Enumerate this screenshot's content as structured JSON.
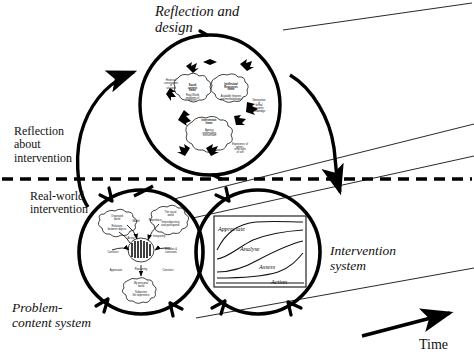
{
  "figure": {
    "title_top": "Reflection and\ndesign",
    "label_reflection_about": "Reflection\nabout\nintervention",
    "label_realworld": "Real-world\nintervention",
    "label_problem_content": "Problem-\ncontent system",
    "label_intervention_system": "Intervention\nsystem",
    "label_time": "Time",
    "divider": "dashed-horizontal-line"
  },
  "circles": {
    "reflection": {
      "name": "reflection-and-design-circle",
      "cx": 210,
      "cy": 105,
      "r": 70
    },
    "problem": {
      "name": "problem-content-system-circle",
      "cx": 141,
      "cy": 252,
      "r": 62
    },
    "intervention": {
      "name": "intervention-system-circle",
      "cx": 258,
      "cy": 252,
      "r": 62
    }
  },
  "reflection_blobs": [
    {
      "id": "blob-social-context",
      "title": "Social\ncontext\nframe",
      "body": "Real-World\nproblems of\ninterest"
    },
    {
      "id": "blob-intellectual-resources",
      "title": "Intellectual\nResources\nframe",
      "body": "Available theories\nand methodologies"
    },
    {
      "id": "blob-intervention",
      "title": "Intervention\nframe",
      "body": "Agency,\nundertaking,\nintervention"
    },
    {
      "id": "note-historical",
      "title": "",
      "body": "Historical\nconstruction\nof\nsituation"
    },
    {
      "id": "note-generation",
      "title": "",
      "body": "Generation\nof\nformal\nsystems\nknowledge"
    },
    {
      "id": "note-experience",
      "title": "",
      "body": "Experience of\nothers,\nreflections\nof self"
    }
  ],
  "problem_blobs": [
    {
      "id": "blob-organised-world",
      "title": "Organised\nworld",
      "body": "Relations\nbetween objects"
    },
    {
      "id": "blob-social-world",
      "title": "The social\nworld",
      "body": "Intersubjectivity\nand participants"
    },
    {
      "id": "blob-personal-world",
      "title": "My personal\nworld",
      "body": "Subjective\nlife experience"
    },
    {
      "id": "blob-core",
      "title": "",
      "body": ""
    }
  ],
  "problem_arrow_labels": [
    "Model",
    "Reproduce",
    "Acting",
    "Integrating",
    "Construct",
    "Enables & constrains",
    "Appreciate",
    "Reasoning",
    "Construct"
  ],
  "inset_chart": {
    "name": "appreciate-analyse-assess-action-chart",
    "curves": [
      {
        "label": "Appreciate",
        "label_x": 4,
        "label_y": 9
      },
      {
        "label": "Analyse",
        "label_x": 26,
        "label_y": 29
      },
      {
        "label": "Assess",
        "label_x": 45,
        "label_y": 47
      },
      {
        "label": "Action",
        "label_x": 57,
        "label_y": 62
      }
    ]
  },
  "arrows": {
    "up_left": "reflection-about-intervention-arrow",
    "down_right": "real-world-intervention-arrow",
    "time": "time-direction-arrow"
  },
  "colors": {
    "ink": "#111111",
    "stroke": "#000000",
    "background": "#ffffff"
  }
}
